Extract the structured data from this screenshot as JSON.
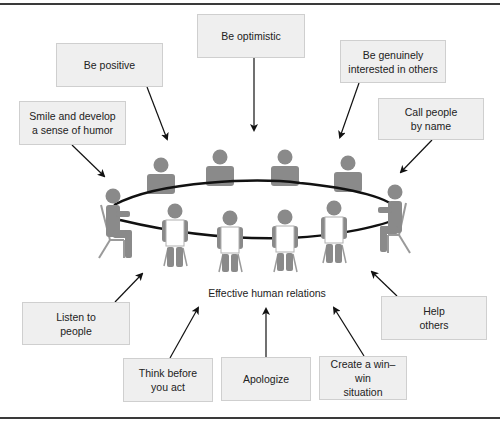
{
  "diagram": {
    "center_label": "Effective human relations",
    "colors": {
      "box_fill": "#efefef",
      "box_border": "#cfcfcf",
      "figure": "#8a8a8a",
      "table_outline": "#111111",
      "frame": "#3a3a3a",
      "text": "#222222"
    },
    "boxes": [
      {
        "id": "be-positive",
        "text": "Be positive"
      },
      {
        "id": "be-optimistic",
        "text": "Be optimistic"
      },
      {
        "id": "be-genuinely-interested",
        "text": "Be genuinely\ninterested in others"
      },
      {
        "id": "smile-humor",
        "text": "Smile and develop\na sense of humor"
      },
      {
        "id": "call-by-name",
        "text": "Call people\nby name"
      },
      {
        "id": "listen",
        "text": "Listen to\npeople"
      },
      {
        "id": "help-others",
        "text": "Help\nothers"
      },
      {
        "id": "think-before",
        "text": "Think before\nyou act"
      },
      {
        "id": "apologize",
        "text": "Apologize"
      },
      {
        "id": "win-win",
        "text": "Create a win–win\nsituation"
      }
    ],
    "figures": {
      "back_row_count": 4,
      "front_row_count": 4,
      "side_count": 2,
      "table": "oval"
    }
  }
}
